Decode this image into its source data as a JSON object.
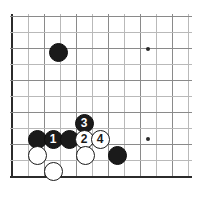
{
  "diagram": {
    "kind": "go-board-joseki-diagram",
    "board": {
      "background_color": "#ffffff",
      "grid_color": "#b9b9b9",
      "edge_color": "#2b2b2b",
      "origin_x": 12,
      "origin_y": 16,
      "spacing": 16,
      "columns": 12,
      "rows": 11,
      "edges": [
        "left",
        "bottom"
      ]
    },
    "star_points": [
      {
        "name": "hoshi-upper-right",
        "x": 148,
        "y": 49
      },
      {
        "name": "hoshi-lower-right",
        "x": 148,
        "y": 139
      }
    ],
    "stones": [
      {
        "name": "black-stone-upper-left",
        "color": "black",
        "label": "",
        "x": 58,
        "y": 52
      },
      {
        "name": "black-stone-left-edge",
        "color": "black",
        "label": "",
        "x": 37,
        "y": 139
      },
      {
        "name": "black-stone-move-1",
        "color": "black",
        "label": "1",
        "x": 53,
        "y": 139
      },
      {
        "name": "black-stone-center",
        "color": "black",
        "label": "",
        "x": 69,
        "y": 139
      },
      {
        "name": "black-stone-move-3",
        "color": "black",
        "label": "3",
        "x": 84,
        "y": 123
      },
      {
        "name": "white-stone-move-2",
        "color": "white",
        "label": "2",
        "x": 84,
        "y": 139
      },
      {
        "name": "white-stone-move-4",
        "color": "white",
        "label": "4",
        "x": 100,
        "y": 139
      },
      {
        "name": "white-stone-lower-left",
        "color": "white",
        "label": "",
        "x": 37,
        "y": 155
      },
      {
        "name": "white-stone-lower-center",
        "color": "white",
        "label": "",
        "x": 85,
        "y": 155
      },
      {
        "name": "black-stone-lower-right",
        "color": "black",
        "label": "",
        "x": 117,
        "y": 155
      },
      {
        "name": "white-stone-bottom",
        "color": "white",
        "label": "",
        "x": 53,
        "y": 171
      }
    ],
    "move_sequence": [
      {
        "number": "1",
        "color": "black"
      },
      {
        "number": "2",
        "color": "white"
      },
      {
        "number": "3",
        "color": "black"
      },
      {
        "number": "4",
        "color": "white"
      }
    ]
  }
}
